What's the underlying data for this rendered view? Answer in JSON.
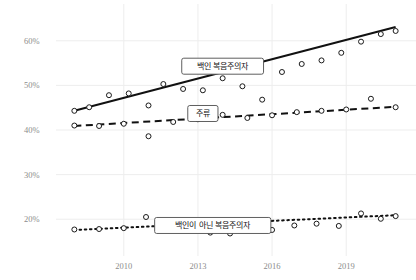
{
  "chart_data": {
    "type": "scatter",
    "title": "",
    "xlabel": "",
    "ylabel": "",
    "xlim": [
      2007.5,
      2021.5
    ],
    "ylim": [
      0.14,
      0.66
    ],
    "grid": true,
    "legend_position": "inline-labels",
    "ytick_labels": [
      "60%",
      "50%",
      "40%",
      "30%",
      "20%"
    ],
    "ytick_values": [
      0.6,
      0.5,
      0.4,
      0.3,
      0.2
    ],
    "xtick_labels": [
      "2010",
      "2013",
      "2016",
      "2019"
    ],
    "xtick_values": [
      2010,
      2013,
      2016,
      2019
    ],
    "series": [
      {
        "name": "백인 복음주의자",
        "label": "백인 복음주의자",
        "line_style": "solid",
        "label_x": 2014.0,
        "label_y": 0.543,
        "trend": {
          "x": [
            2008.0,
            2021.0
          ],
          "y": [
            0.443,
            0.631
          ]
        },
        "x": [
          2008.0,
          2008.6,
          2009.4,
          2010.2,
          2011.0,
          2011.6,
          2012.4,
          2013.2,
          2014.0,
          2014.8,
          2015.6,
          2016.4,
          2017.2,
          2018.0,
          2018.8,
          2019.6,
          2020.4,
          2021.0
        ],
        "y": [
          0.443,
          0.451,
          0.478,
          0.482,
          0.455,
          0.503,
          0.492,
          0.489,
          0.516,
          0.498,
          0.468,
          0.53,
          0.548,
          0.556,
          0.573,
          0.598,
          0.615,
          0.622
        ]
      },
      {
        "name": "주류",
        "label": "주류",
        "line_style": "dashed",
        "label_x": 2013.2,
        "label_y": 0.437,
        "trend": {
          "x": [
            2008.0,
            2021.0
          ],
          "y": [
            0.409,
            0.452
          ]
        },
        "x": [
          2008.0,
          2009.0,
          2010.0,
          2011.0,
          2012.0,
          2013.0,
          2014.0,
          2015.0,
          2016.0,
          2017.0,
          2018.0,
          2019.0,
          2020.0,
          2021.0
        ],
        "y": [
          0.41,
          0.409,
          0.414,
          0.386,
          0.418,
          0.424,
          0.434,
          0.427,
          0.433,
          0.44,
          0.443,
          0.446,
          0.47,
          0.451
        ]
      },
      {
        "name": "백인이 아닌 복음주의자",
        "label": "백인이 아닌 복음주의자",
        "line_style": "dotted",
        "label_x": 2013.6,
        "label_y": 0.186,
        "trend": {
          "x": [
            2008.0,
            2021.0
          ],
          "y": [
            0.176,
            0.209
          ]
        },
        "x": [
          2008.0,
          2009.0,
          2010.0,
          2010.9,
          2011.8,
          2012.7,
          2013.5,
          2014.3,
          2015.1,
          2016.0,
          2016.9,
          2017.8,
          2018.7,
          2019.6,
          2020.4,
          2021.0
        ],
        "y": [
          0.177,
          0.178,
          0.18,
          0.205,
          0.18,
          0.187,
          0.17,
          0.168,
          0.181,
          0.176,
          0.186,
          0.19,
          0.185,
          0.213,
          0.201,
          0.207
        ]
      }
    ]
  }
}
